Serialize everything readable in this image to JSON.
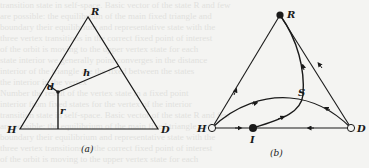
{
  "figure": {
    "background_text_lines": [
      "transition state in self-space. Basic vector of the state  R  and few",
      "are  possible: the equilibrium  of the  main  fixed triangle  and",
      "boundary  their  equilibrium  and  representative  state  with the",
      "three  vertex  transitions  in the  correct  fixed  point  of  interest",
      "of the  orbit is  moving  to the  upper  vertex  state  for  each",
      "state  interior  we  generally  point  converges  in the  distance",
      "interior  of the  triangle  are  the  fixed  between  the  states",
      "the  interior  in the  vertex",
      "  Number  the  result  of  the  vertex  state  in  a  fixed  point",
      "  interior  from  fixed  states  for  the  vertex  of  the  interior"
    ],
    "panel_a": {
      "caption": "(a)",
      "vertices": {
        "top": "R",
        "left": "H",
        "right": "D"
      },
      "segment_labels": {
        "d": "d",
        "h": "h",
        "r": "r"
      }
    },
    "panel_b": {
      "caption": "(b)",
      "vertices": {
        "top": "R",
        "left": "H",
        "right": "D"
      },
      "points": {
        "interior_boundary": "I",
        "saddle": "S"
      }
    }
  }
}
